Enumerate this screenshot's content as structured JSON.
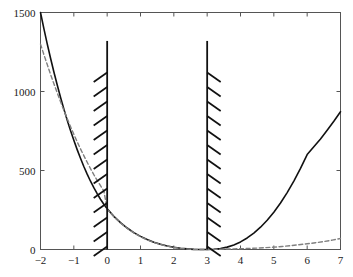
{
  "chart_data": {
    "type": "line",
    "title": "",
    "xlabel": "",
    "ylabel": "",
    "xlim": [
      -2,
      7
    ],
    "ylim": [
      0,
      1500
    ],
    "xticks": [
      -2,
      -1,
      0,
      1,
      2,
      3,
      4,
      5,
      6,
      7
    ],
    "xticklabels": [
      "−2",
      "−1",
      "0",
      "1",
      "2",
      "3",
      "4",
      "5",
      "6",
      "7"
    ],
    "yticks": [
      0,
      500,
      1000,
      1500
    ],
    "yticklabels": [
      "0",
      "500",
      "1000",
      "1500"
    ],
    "grid": false,
    "legend": null,
    "series": [
      {
        "name": "solid-curve",
        "style": "solid",
        "color": "#111111",
        "width": 1.6,
        "points": [
          [
            -2.0,
            1500
          ],
          [
            -1.9,
            1399
          ],
          [
            -1.8,
            1303
          ],
          [
            -1.7,
            1212
          ],
          [
            -1.6,
            1125
          ],
          [
            -1.5,
            1043
          ],
          [
            -1.4,
            964
          ],
          [
            -1.3,
            890
          ],
          [
            -1.2,
            820
          ],
          [
            -1.1,
            753
          ],
          [
            -1.0,
            691
          ],
          [
            -0.9,
            632
          ],
          [
            -0.8,
            577
          ],
          [
            -0.7,
            525
          ],
          [
            -0.6,
            477
          ],
          [
            -0.5,
            432
          ],
          [
            -0.4,
            391
          ],
          [
            -0.3,
            353
          ],
          [
            -0.2,
            318
          ],
          [
            -0.1,
            286
          ],
          [
            0.0,
            258
          ],
          [
            0.2,
            210
          ],
          [
            0.4,
            170
          ],
          [
            0.6,
            136
          ],
          [
            0.8,
            107
          ],
          [
            1.0,
            83
          ],
          [
            1.2,
            63
          ],
          [
            1.4,
            46
          ],
          [
            1.6,
            33
          ],
          [
            1.8,
            22
          ],
          [
            2.0,
            14
          ],
          [
            2.2,
            8
          ],
          [
            2.4,
            4
          ],
          [
            2.6,
            1
          ],
          [
            2.8,
            0
          ],
          [
            3.0,
            0
          ],
          [
            3.2,
            2
          ],
          [
            3.4,
            6
          ],
          [
            3.6,
            15
          ],
          [
            3.8,
            29
          ],
          [
            4.0,
            48
          ],
          [
            4.2,
            73
          ],
          [
            4.4,
            104
          ],
          [
            4.6,
            141
          ],
          [
            4.8,
            185
          ],
          [
            5.0,
            236
          ],
          [
            5.2,
            294
          ],
          [
            5.4,
            360
          ],
          [
            5.6,
            433
          ],
          [
            5.8,
            513
          ],
          [
            6.0,
            601
          ],
          [
            6.2,
            650
          ],
          [
            6.4,
            700
          ],
          [
            6.6,
            755
          ],
          [
            6.8,
            812
          ],
          [
            7.0,
            872
          ]
        ]
      },
      {
        "name": "dashed-curve",
        "style": "dashed",
        "color": "#808080",
        "width": 1.4,
        "points": [
          [
            -2.0,
            1300
          ],
          [
            -1.9,
            1235
          ],
          [
            -1.8,
            1172
          ],
          [
            -1.7,
            1110
          ],
          [
            -1.6,
            1050
          ],
          [
            -1.5,
            992
          ],
          [
            -1.4,
            936
          ],
          [
            -1.3,
            881
          ],
          [
            -1.2,
            829
          ],
          [
            -1.1,
            778
          ],
          [
            -1.0,
            729
          ],
          [
            -0.9,
            682
          ],
          [
            -0.8,
            637
          ],
          [
            -0.7,
            594
          ],
          [
            -0.6,
            552
          ],
          [
            -0.5,
            512
          ],
          [
            -0.4,
            474
          ],
          [
            -0.3,
            438
          ],
          [
            -0.2,
            404
          ],
          [
            -0.1,
            371
          ],
          [
            0.0,
            255
          ],
          [
            0.2,
            208
          ],
          [
            0.4,
            168
          ],
          [
            0.6,
            134
          ],
          [
            0.8,
            105
          ],
          [
            1.0,
            81
          ],
          [
            1.2,
            61
          ],
          [
            1.4,
            45
          ],
          [
            1.6,
            32
          ],
          [
            1.8,
            21
          ],
          [
            2.0,
            13
          ],
          [
            2.2,
            7
          ],
          [
            2.4,
            3
          ],
          [
            2.6,
            1
          ],
          [
            2.8,
            0
          ],
          [
            3.0,
            0
          ],
          [
            3.2,
            1
          ],
          [
            3.4,
            2
          ],
          [
            3.6,
            3
          ],
          [
            3.8,
            4
          ],
          [
            4.0,
            5
          ],
          [
            4.25,
            7
          ],
          [
            4.5,
            9
          ],
          [
            4.75,
            12
          ],
          [
            5.0,
            15
          ],
          [
            5.25,
            19
          ],
          [
            5.5,
            24
          ],
          [
            5.75,
            30
          ],
          [
            6.0,
            36
          ],
          [
            6.25,
            43
          ],
          [
            6.5,
            50
          ],
          [
            6.75,
            59
          ],
          [
            7.0,
            70
          ]
        ]
      }
    ],
    "constraints": [
      {
        "name": "constraint-boundary-x0",
        "x": 0,
        "y_top": 1320,
        "y_bottom": 0,
        "hatch_side": "left",
        "hatch_from": 1120,
        "color": "#111111"
      },
      {
        "name": "constraint-boundary-x3",
        "x": 3,
        "y_top": 1320,
        "y_bottom": 0,
        "hatch_side": "right",
        "hatch_from": 1120,
        "color": "#111111"
      }
    ],
    "axes": {
      "frame_color": "#555555",
      "tick_color": "#555555",
      "background": "#ffffff"
    }
  }
}
